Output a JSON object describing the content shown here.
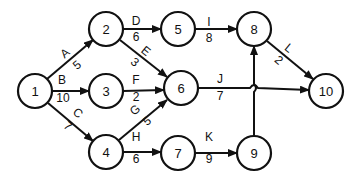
{
  "diagram": {
    "type": "activity-network",
    "nodes": [
      {
        "id": "1",
        "label": "1",
        "x": 35,
        "y": 91
      },
      {
        "id": "2",
        "label": "2",
        "x": 106,
        "y": 29
      },
      {
        "id": "3",
        "label": "3",
        "x": 106,
        "y": 91
      },
      {
        "id": "4",
        "label": "4",
        "x": 106,
        "y": 152
      },
      {
        "id": "5",
        "label": "5",
        "x": 178,
        "y": 29
      },
      {
        "id": "6",
        "label": "6",
        "x": 181,
        "y": 88
      },
      {
        "id": "7",
        "label": "7",
        "x": 178,
        "y": 153
      },
      {
        "id": "8",
        "label": "8",
        "x": 254,
        "y": 29
      },
      {
        "id": "9",
        "label": "9",
        "x": 254,
        "y": 153
      },
      {
        "id": "10",
        "label": "10",
        "x": 326,
        "y": 91
      }
    ],
    "edges": [
      {
        "activity": "A",
        "duration": "5",
        "from": "1",
        "to": "2"
      },
      {
        "activity": "B",
        "duration": "10",
        "from": "1",
        "to": "3"
      },
      {
        "activity": "C",
        "duration": "7",
        "from": "1",
        "to": "4"
      },
      {
        "activity": "D",
        "duration": "6",
        "from": "2",
        "to": "5"
      },
      {
        "activity": "E",
        "duration": "3",
        "from": "2",
        "to": "6"
      },
      {
        "activity": "F",
        "duration": "2",
        "from": "3",
        "to": "6"
      },
      {
        "activity": "G",
        "duration": "5",
        "from": "4",
        "to": "6"
      },
      {
        "activity": "H",
        "duration": "6",
        "from": "4",
        "to": "7"
      },
      {
        "activity": "I",
        "duration": "8",
        "from": "5",
        "to": "8"
      },
      {
        "activity": "J",
        "duration": "7",
        "from": "6",
        "to": "10"
      },
      {
        "activity": "K",
        "duration": "9",
        "from": "7",
        "to": "9"
      },
      {
        "activity": "L",
        "duration": "2",
        "from": "8",
        "to": "10"
      },
      {
        "activity": "",
        "duration": "",
        "from": "9",
        "to": "8"
      }
    ]
  }
}
